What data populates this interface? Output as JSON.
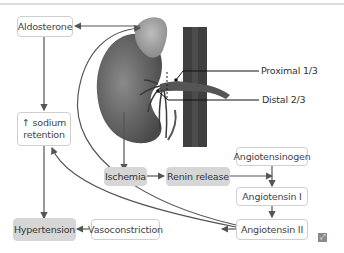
{
  "diagram": {
    "nodes": {
      "aldosterone": "Aldosterone",
      "sodium_line1": "↑ sodium",
      "sodium_line2": "retention",
      "ischemia": "Ischemia",
      "renin": "Renin release",
      "angiotensinogen": "Angiotensinogen",
      "angiotensin1": "Angiotensin I",
      "angiotensin2": "Angiotensin II",
      "vasoconstriction": "Vasoconstriction",
      "hypertension": "Hypertension"
    },
    "labels": {
      "proximal": "Proximal 1/3",
      "distal": "Distal 2/3"
    },
    "icons": {
      "expand": "expand-icon"
    }
  }
}
